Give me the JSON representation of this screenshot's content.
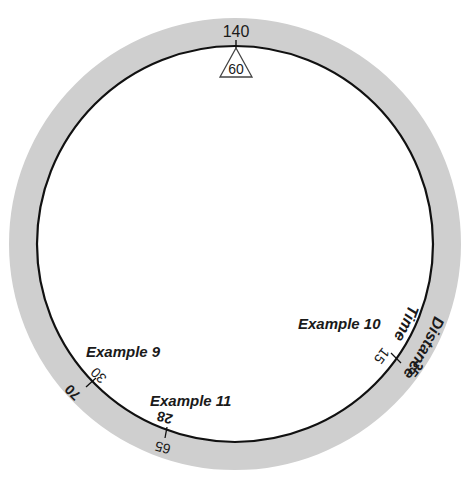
{
  "diagram": {
    "colors": {
      "band": "#cfcfcf",
      "line": "#111111",
      "background": "#ffffff"
    },
    "scales": {
      "outer_label": "Distance",
      "inner_label": "Time"
    },
    "index": {
      "distance_value": "140",
      "time_value": "60",
      "marker": "triangle-index-icon"
    },
    "marks": [
      {
        "id": "example-9",
        "label": "Example 9",
        "distance": "70",
        "time": "30"
      },
      {
        "id": "example-10",
        "label": "Example 10",
        "distance": "35",
        "time": "15"
      },
      {
        "id": "example-11",
        "label": "Example 11",
        "distance": "65",
        "time": "28"
      }
    ]
  }
}
